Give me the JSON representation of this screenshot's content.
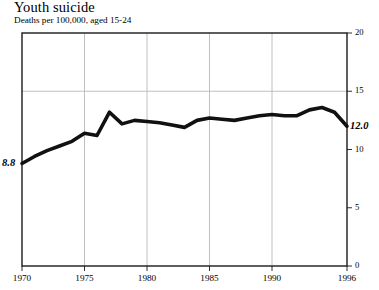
{
  "chart_data": {
    "type": "line",
    "title": "Youth suicide",
    "subtitle": "Deaths per 100,000, aged 15-24",
    "xlabel": "",
    "ylabel": "",
    "ylim": [
      0,
      20
    ],
    "xlim": [
      1970,
      1996
    ],
    "grid": "horizontal-at-15-and-vertical-at-5-year-ticks",
    "legend": "none",
    "line_color": "#111111",
    "x": [
      1970,
      1971,
      1972,
      1973,
      1974,
      1975,
      1976,
      1977,
      1978,
      1979,
      1980,
      1981,
      1982,
      1983,
      1984,
      1985,
      1986,
      1987,
      1988,
      1989,
      1990,
      1991,
      1992,
      1993,
      1994,
      1995,
      1996
    ],
    "values": [
      8.8,
      9.4,
      9.9,
      10.3,
      10.7,
      11.4,
      11.2,
      13.2,
      12.2,
      12.5,
      12.4,
      12.3,
      12.1,
      11.9,
      12.5,
      12.7,
      12.6,
      12.5,
      12.7,
      12.9,
      13.0,
      12.9,
      12.9,
      13.4,
      13.6,
      13.2,
      12.0
    ],
    "yticks": [
      0,
      5,
      10,
      15,
      20
    ],
    "ytick_labels": [
      "0",
      "5",
      "10",
      "15",
      "20"
    ],
    "xticks": [
      1970,
      1975,
      1980,
      1985,
      1990,
      1996
    ],
    "xtick_labels": [
      "1970",
      "1975",
      "1980",
      "1985",
      "1990",
      "1996"
    ],
    "annotations": [
      {
        "name": "start-value",
        "text": "8.8",
        "x": 1970,
        "y": 8.8
      },
      {
        "name": "end-value",
        "text": "12.0",
        "x": 1996,
        "y": 12.0
      }
    ]
  }
}
